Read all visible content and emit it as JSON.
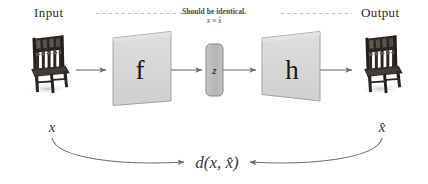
{
  "diagram": {
    "background": "#ffffff"
  },
  "labels": {
    "input": "Input",
    "output": "Output",
    "note_text": "Should be identical.",
    "note_math": "x ≈ x̂",
    "encoder_glyph": "f",
    "latent_glyph": "z",
    "decoder_glyph": "h",
    "var_input": "x",
    "var_output": "x̂",
    "distance": "d(x, x̂)"
  },
  "nodes": [
    {
      "id": "input-image",
      "kind": "image",
      "name": "chair-photo-input",
      "caption": "x"
    },
    {
      "id": "encoder",
      "kind": "trapezoid",
      "name": "encoder-block",
      "glyph": "f"
    },
    {
      "id": "latent",
      "kind": "capsule",
      "name": "latent-code-block",
      "glyph": "z"
    },
    {
      "id": "decoder",
      "kind": "trapezoid",
      "name": "decoder-block",
      "glyph": "h"
    },
    {
      "id": "output-image",
      "kind": "image",
      "name": "chair-photo-output",
      "caption": "x̂"
    }
  ],
  "edges": [
    {
      "from": "input-image",
      "to": "encoder",
      "style": "solid-arrow"
    },
    {
      "from": "encoder",
      "to": "latent",
      "style": "solid-arrow"
    },
    {
      "from": "latent",
      "to": "decoder",
      "style": "solid-arrow"
    },
    {
      "from": "decoder",
      "to": "output-image",
      "style": "solid-arrow"
    },
    {
      "from": "input-image",
      "to": "distance",
      "style": "curved-arrow"
    },
    {
      "from": "output-image",
      "to": "distance",
      "style": "curved-arrow"
    },
    {
      "from": "input-label",
      "to": "output-label",
      "style": "dashed-line"
    }
  ],
  "colors": {
    "block_fill": "#d2d2d2",
    "block_fill_light": "#dadada",
    "block_stroke": "#8a8a8a",
    "latent_fill": "#b9b9b9",
    "latent_stroke": "#7d7d7d",
    "arrow": "#6f6f6f",
    "dashed": "#c2c2c2",
    "curve": "#6b6b6b",
    "text_dark": "#2b2b2b",
    "text_mid": "#4a4a4a",
    "chair_dark": "#2a2622",
    "chair_shadow": "#c9c9c9",
    "background": "#ffffff"
  }
}
